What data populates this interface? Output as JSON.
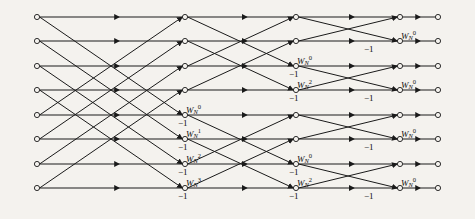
{
  "figure": {
    "kind": "fft-butterfly-signal-flow-graph",
    "background_color": "#f4f2ee",
    "line_color": "#1a1a1a",
    "node_fill": "#f4f2ee",
    "radix": 2,
    "points": 8,
    "stages": 3
  },
  "geometry": {
    "row_y": [
      17,
      41,
      66,
      90,
      115,
      139,
      164,
      188
    ],
    "column_x": [
      37,
      110,
      185,
      233,
      296,
      345,
      400,
      438
    ],
    "node_radius": 2.6
  },
  "inputs": [
    {
      "label": "x(0)",
      "row": 0
    },
    {
      "label": "x(1)",
      "row": 1
    },
    {
      "label": "x(2)",
      "row": 2
    },
    {
      "label": "x(3)",
      "row": 3
    },
    {
      "label": "x(4)",
      "row": 4
    },
    {
      "label": "x(5)",
      "row": 5
    },
    {
      "label": "x(6)",
      "row": 6
    },
    {
      "label": "x(7)",
      "row": 7
    }
  ],
  "outputs": [
    {
      "label": "X(0)",
      "row": 0
    },
    {
      "label": "X(4)",
      "row": 1
    },
    {
      "label": "X(2)",
      "row": 2
    },
    {
      "label": "X(6)",
      "row": 3
    },
    {
      "label": "X(1)",
      "row": 4
    },
    {
      "label": "X(5)",
      "row": 5
    },
    {
      "label": "X(3)",
      "row": 6
    },
    {
      "label": "X(7)",
      "row": 7
    }
  ],
  "twiddle": {
    "base": "W",
    "subscript": "N",
    "stage1_exponents": [
      "0",
      "1",
      "2",
      "3"
    ],
    "stage2_exponents": [
      "0",
      "2",
      "0",
      "2"
    ],
    "stage3_exponents": [
      "0",
      "0",
      "0",
      "0"
    ]
  },
  "twiddle_labels": [
    {
      "stage": 1,
      "row": 4,
      "base": "W",
      "sub": "N",
      "sup": "0",
      "x": 186,
      "y": 104
    },
    {
      "stage": 1,
      "row": 5,
      "base": "W",
      "sub": "N",
      "sup": "1",
      "x": 186,
      "y": 128
    },
    {
      "stage": 1,
      "row": 6,
      "base": "W",
      "sub": "N",
      "sup": "2",
      "x": 186,
      "y": 153
    },
    {
      "stage": 1,
      "row": 7,
      "base": "W",
      "sub": "N",
      "sup": "3",
      "x": 186,
      "y": 177
    },
    {
      "stage": 2,
      "row": 2,
      "base": "W",
      "sub": "N",
      "sup": "0",
      "x": 297,
      "y": 55
    },
    {
      "stage": 2,
      "row": 3,
      "base": "W",
      "sub": "N",
      "sup": "2",
      "x": 297,
      "y": 79
    },
    {
      "stage": 2,
      "row": 6,
      "base": "W",
      "sub": "N",
      "sup": "0",
      "x": 297,
      "y": 153
    },
    {
      "stage": 2,
      "row": 7,
      "base": "W",
      "sub": "N",
      "sup": "2",
      "x": 297,
      "y": 177
    },
    {
      "stage": 3,
      "row": 1,
      "base": "W",
      "sub": "N",
      "sup": "0",
      "x": 401,
      "y": 30
    },
    {
      "stage": 3,
      "row": 3,
      "base": "W",
      "sub": "N",
      "sup": "0",
      "x": 401,
      "y": 79
    },
    {
      "stage": 3,
      "row": 5,
      "base": "W",
      "sub": "N",
      "sup": "0",
      "x": 401,
      "y": 128
    },
    {
      "stage": 3,
      "row": 7,
      "base": "W",
      "sub": "N",
      "sup": "0",
      "x": 401,
      "y": 177
    }
  ],
  "minus_one_labels": [
    {
      "text": "−1",
      "stage": 1,
      "row": 4,
      "x": 178,
      "y": 119
    },
    {
      "text": "−1",
      "stage": 1,
      "row": 5,
      "x": 178,
      "y": 143
    },
    {
      "text": "−1",
      "stage": 1,
      "row": 6,
      "x": 178,
      "y": 168
    },
    {
      "text": "−1",
      "stage": 1,
      "row": 7,
      "x": 178,
      "y": 192
    },
    {
      "text": "−1",
      "stage": 2,
      "row": 2,
      "x": 289,
      "y": 70
    },
    {
      "text": "−1",
      "stage": 2,
      "row": 3,
      "x": 289,
      "y": 94
    },
    {
      "text": "−1",
      "stage": 2,
      "row": 6,
      "x": 289,
      "y": 168
    },
    {
      "text": "−1",
      "stage": 2,
      "row": 7,
      "x": 289,
      "y": 192
    },
    {
      "text": "−1",
      "stage": 3,
      "row": 1,
      "x": 364,
      "y": 45
    },
    {
      "text": "−1",
      "stage": 3,
      "row": 3,
      "x": 364,
      "y": 94
    },
    {
      "text": "−1",
      "stage": 3,
      "row": 5,
      "x": 364,
      "y": 143
    },
    {
      "text": "−1",
      "stage": 3,
      "row": 7,
      "x": 364,
      "y": 192
    }
  ],
  "chart_data": {
    "type": "diagram",
    "input_sequence": [
      "x(0)",
      "x(1)",
      "x(2)",
      "x(3)",
      "x(4)",
      "x(5)",
      "x(6)",
      "x(7)"
    ],
    "output_sequence": [
      "X(0)",
      "X(4)",
      "X(2)",
      "X(6)",
      "X(1)",
      "X(5)",
      "X(3)",
      "X(7)"
    ],
    "stage_spans": [
      4,
      2,
      1
    ],
    "stage_twiddles": [
      [
        "W_N^0",
        "W_N^1",
        "W_N^2",
        "W_N^3"
      ],
      [
        "W_N^0",
        "W_N^2",
        "W_N^0",
        "W_N^2"
      ],
      [
        "W_N^0",
        "W_N^0",
        "W_N^0",
        "W_N^0"
      ]
    ],
    "negation_count_per_stage": [
      4,
      4,
      4
    ]
  }
}
